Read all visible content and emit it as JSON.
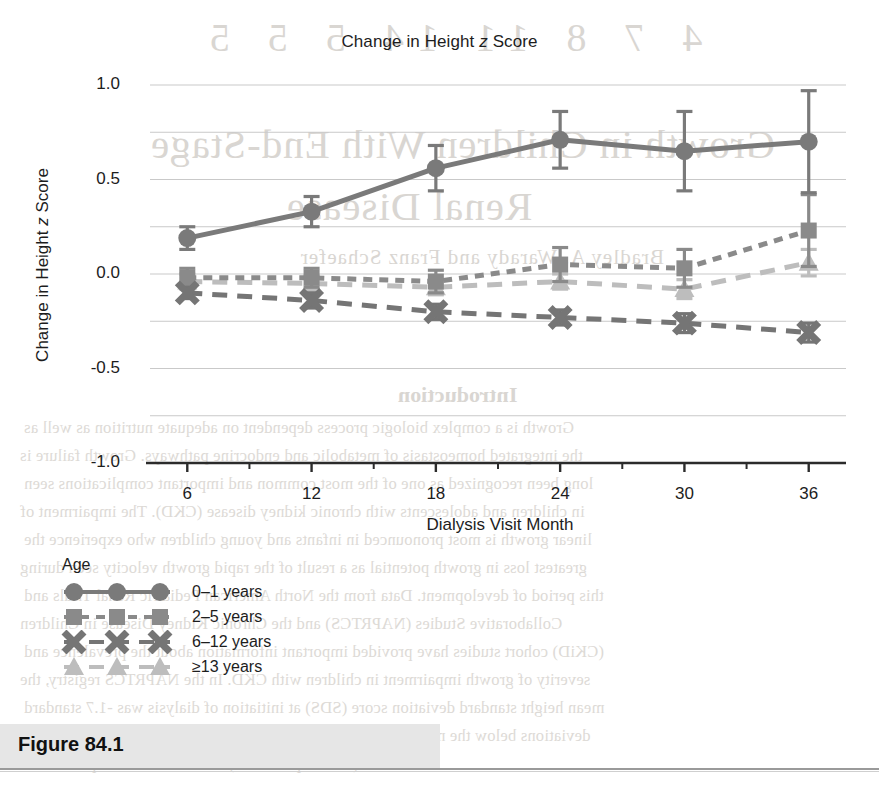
{
  "figure": {
    "label": "Figure 84.1",
    "band_color": "#e6e6e6"
  },
  "chart_data": {
    "type": "line",
    "title": "Change in Height z Score",
    "title_plain": "Change in Height z Score",
    "title_pre": "Change in Height ",
    "title_italic": "z",
    "title_post": " Score",
    "xlabel": "Dialysis Visit Month",
    "ylabel": "Change in Height z Score",
    "ylabel_pre": "Change in Height ",
    "ylabel_italic": "z",
    "ylabel_post": " Score",
    "x": [
      6,
      12,
      18,
      24,
      30,
      36
    ],
    "categories": [
      "6",
      "12",
      "18",
      "24",
      "30",
      "36"
    ],
    "xticklabels": [
      "6",
      "12",
      "18",
      "24",
      "30",
      "36"
    ],
    "yticklabels": [
      "1.0",
      "0.5",
      "0.0",
      "-0.5",
      "-1.0"
    ],
    "ytickvalues": [
      1.0,
      0.5,
      0.0,
      -0.5,
      -1.0
    ],
    "gridline_values": [
      1.0,
      0.75,
      0.5,
      0.25,
      0.0,
      -0.25,
      -0.5,
      -0.75,
      -1.0
    ],
    "xlim": [
      4.2,
      37.8
    ],
    "ylim": [
      -1.0,
      1.0
    ],
    "grid": true,
    "grid_color": "#c9c9c9",
    "axis_color": "#2b2b2b",
    "legend_title": "Age",
    "legend_position": "below-left",
    "series": [
      {
        "name": "0-1 years",
        "label": "0–1 years",
        "marker": "circle",
        "linestyle": "solid",
        "color": "#7a7a7a",
        "values": [
          0.19,
          0.33,
          0.56,
          0.71,
          0.65,
          0.7
        ],
        "err_low": [
          0.06,
          0.08,
          0.12,
          0.15,
          0.21,
          0.27
        ],
        "err_high": [
          0.06,
          0.08,
          0.12,
          0.15,
          0.21,
          0.27
        ]
      },
      {
        "name": "2-5 years",
        "label": "2–5 years",
        "marker": "square",
        "linestyle": "dotted",
        "color": "#8a8a8a",
        "values": [
          -0.02,
          -0.02,
          -0.04,
          0.05,
          0.03,
          0.23
        ],
        "err_low": [
          0.05,
          0.05,
          0.06,
          0.09,
          0.1,
          0.19
        ],
        "err_high": [
          0.05,
          0.05,
          0.06,
          0.09,
          0.1,
          0.19
        ]
      },
      {
        "name": "6-12 years",
        "label": "6–12 years",
        "marker": "x",
        "linestyle": "dashed",
        "color": "#757575",
        "values": [
          -0.1,
          -0.14,
          -0.2,
          -0.23,
          -0.26,
          -0.31
        ],
        "err_low": [
          0.03,
          0.04,
          0.04,
          0.04,
          0.05,
          0.05
        ],
        "err_high": [
          0.03,
          0.04,
          0.04,
          0.04,
          0.05,
          0.05
        ]
      },
      {
        "name": ">=13 years",
        "label": "≥13 years",
        "marker": "triangle",
        "linestyle": "dashed",
        "color": "#bdbdbd",
        "values": [
          -0.04,
          -0.05,
          -0.07,
          -0.04,
          -0.08,
          0.06
        ],
        "err_low": [
          0.04,
          0.04,
          0.04,
          0.04,
          0.05,
          0.07
        ],
        "err_high": [
          0.04,
          0.04,
          0.04,
          0.04,
          0.05,
          0.07
        ]
      }
    ]
  },
  "bleedthrough": {
    "title_a": "4  7  8  11  14  5  5  5",
    "title_b": "Growth in Children With End-Stage",
    "title_c": "Renal Disease",
    "title_d": "Bradley A. Warady and Franz Schaefer",
    "heading": "Introduction",
    "lines": [
      "Growth is a complex biologic process dependent on adequate nutrition as well as",
      "the integrated homeostasis of metabolic and endocrine pathways. Growth failure is",
      "long been recognized as one of the most common and important complications seen",
      "in children and adolescents with chronic kidney disease (CKD). The impairment of",
      "linear growth is most pronounced in infants and young children who experience the",
      "greatest loss in growth potential as a result of the rapid growth velocity seen during",
      "this period of development. Data from the North American Pediatric Renal Trials and",
      "Collaborative Studies (NAPRTCS) and the Chronic Kidney Disease in Children",
      "(CKiD) cohort studies have provided important information about the prevalence and",
      "severity of growth impairment in children with CKD. In the NAPRTCS registry, the",
      "mean height standard deviation score (SDS) at initiation of dialysis was -1.7 standard",
      "deviations below the mean, and nearly one third of patients had a height SDS below",
      "-1.88 (the 3rd percentile) at the time of transplantation."
    ]
  }
}
